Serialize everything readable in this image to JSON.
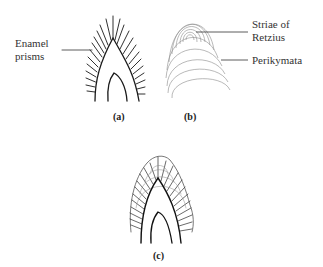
{
  "figure": {
    "panels": [
      {
        "id": "a",
        "caption": "(a)",
        "labels": [
          {
            "text_line1": "Enamel",
            "text_line2": "prisms"
          }
        ]
      },
      {
        "id": "b",
        "caption": "(b)",
        "labels": [
          {
            "text_line1": "Striae of",
            "text_line2": "Retzius"
          },
          {
            "text_line1": "Perikymata"
          }
        ]
      },
      {
        "id": "c",
        "caption": "(c)"
      }
    ],
    "colors": {
      "line": "#1a1a1a",
      "faint_line": "#8a8a8a",
      "background": "#ffffff"
    }
  }
}
